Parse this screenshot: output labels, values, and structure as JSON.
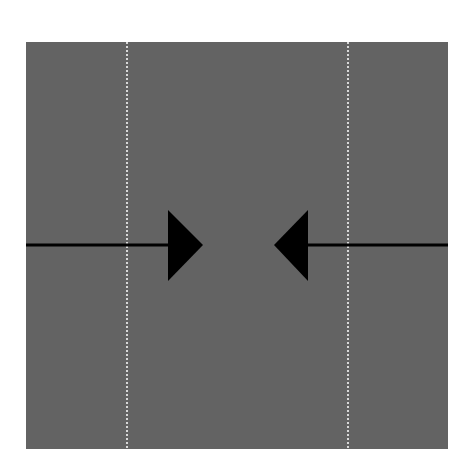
{
  "diagram": {
    "background_color": "#ffffff",
    "panel": {
      "x": 26,
      "y": 42,
      "width": 422,
      "height": 407,
      "fill": "#636363"
    },
    "guides": [
      {
        "x": 127,
        "color": "#ffffff",
        "style": "dotted"
      },
      {
        "x": 348,
        "color": "#ffffff",
        "style": "dotted"
      }
    ],
    "arrows": [
      {
        "id": "left-arrow",
        "direction": "right",
        "line_from": 26,
        "line_to": 170,
        "y": 245,
        "head_base_x": 168,
        "head_tip_x": 203,
        "head_top_y": 210,
        "head_bottom_y": 281,
        "color": "#000000"
      },
      {
        "id": "right-arrow",
        "direction": "left",
        "line_from": 306,
        "line_to": 448,
        "y": 245,
        "head_base_x": 308,
        "head_tip_x": 274,
        "head_top_y": 210,
        "head_bottom_y": 281,
        "color": "#000000"
      }
    ]
  }
}
